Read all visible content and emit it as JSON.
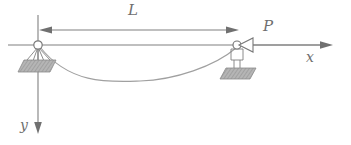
{
  "diagram": {
    "type": "engineering-beam-diagram",
    "background_color": "#ffffff",
    "line_color": "#808080",
    "curve_color": "#9a9a9a",
    "hatch_fill_color": "#a8a8a8",
    "labels": {
      "span": "L",
      "load": "P",
      "x_axis": "x",
      "y_axis": "y"
    },
    "geometry": {
      "axis_y": 45,
      "left_support_x": 38,
      "right_support_x": 237,
      "x_axis_start": 8,
      "x_axis_end": 330,
      "y_axis_top": 15,
      "y_axis_bottom": 132,
      "dimension_line_y": 30,
      "curve_min_x": 140,
      "curve_min_y": 80
    },
    "elements": [
      {
        "name": "left-pin-support",
        "kind": "pin",
        "x": 38,
        "y": 45
      },
      {
        "name": "right-roller-support",
        "kind": "roller",
        "x": 237,
        "y": 45
      },
      {
        "name": "span-dimension",
        "label": "L",
        "from_x": 40,
        "to_x": 237
      },
      {
        "name": "axial-load-arrow",
        "label": "P",
        "direction": "left",
        "tip_x": 238
      },
      {
        "name": "deflection-curve",
        "kind": "sag-curve"
      },
      {
        "name": "x-axis",
        "label": "x",
        "direction": "right"
      },
      {
        "name": "y-axis",
        "label": "y",
        "direction": "down"
      }
    ]
  }
}
